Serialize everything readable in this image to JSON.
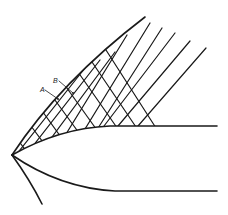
{
  "figure": {
    "labels": [
      {
        "id": "A",
        "text": "A"
      },
      {
        "id": "B",
        "text": "B"
      }
    ]
  }
}
